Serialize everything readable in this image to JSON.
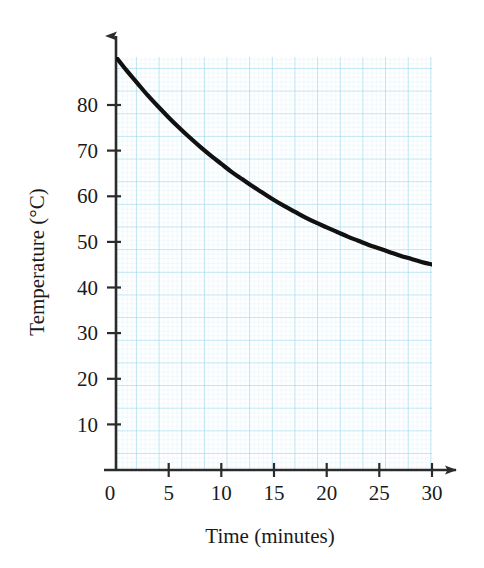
{
  "chart_data": {
    "type": "line",
    "title": "",
    "xlabel": "Time (minutes)",
    "ylabel": "Temperature (°C)",
    "xlim": [
      0,
      30
    ],
    "ylim": [
      0,
      80
    ],
    "xticks": [
      0,
      5,
      10,
      15,
      20,
      25,
      30
    ],
    "xtick_labels": [
      "0",
      "5",
      "10",
      "15",
      "20",
      "25",
      "30"
    ],
    "yticks": [
      10,
      20,
      30,
      40,
      50,
      60,
      70,
      80
    ],
    "ytick_labels": [
      "10",
      "20",
      "30",
      "40",
      "50",
      "60",
      "70",
      "80"
    ],
    "grid": true,
    "grid_color": "#9fd8ec",
    "grid_minor_color": "#cfeaf6",
    "legend": null,
    "series": [
      {
        "name": "Cooling curve",
        "color": "#111111",
        "x": [
          0,
          1,
          2,
          3,
          4,
          5,
          6,
          7,
          8,
          9,
          10,
          11,
          12,
          13,
          14,
          15,
          16,
          17,
          18,
          19,
          20,
          21,
          22,
          23,
          24,
          25,
          26,
          27,
          28,
          29,
          30
        ],
        "y": [
          80.0,
          77.4,
          75.0,
          72.6,
          70.4,
          68.3,
          66.3,
          64.4,
          62.6,
          60.9,
          59.3,
          57.7,
          56.3,
          54.9,
          53.6,
          52.3,
          51.1,
          50.0,
          48.9,
          47.9,
          47.0,
          46.1,
          45.2,
          44.4,
          43.6,
          42.9,
          42.2,
          41.5,
          40.9,
          40.3,
          39.8
        ]
      }
    ]
  },
  "axes": {
    "x_axis_label": "Time (minutes)",
    "y_axis_label": "Temperature (°C)",
    "origin_label": "0"
  },
  "colors": {
    "curve": "#111111",
    "axis": "#2b2b2b",
    "grid_major": "#7ecbe8",
    "grid_minor": "#cbe9f5",
    "background": "#ffffff"
  }
}
